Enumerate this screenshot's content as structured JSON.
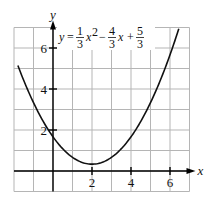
{
  "chart_data": {
    "type": "line",
    "title": "",
    "equation": {
      "display": "y = 1/3 x^2 - 4/3 x + 5/3",
      "lhs": "y",
      "terms": [
        {
          "sign": "",
          "num": "1",
          "den": "3",
          "var": "x",
          "exp": "2"
        },
        {
          "sign": "−",
          "num": "4",
          "den": "3",
          "var": "x",
          "exp": ""
        },
        {
          "sign": "+",
          "num": "5",
          "den": "3",
          "var": "",
          "exp": ""
        }
      ],
      "coefficients": {
        "a": 0.3333,
        "b": -1.3333,
        "c": 1.6667
      }
    },
    "xlabel": "x",
    "ylabel": "y",
    "xlim": [
      -2,
      7
    ],
    "ylim": [
      -1,
      7
    ],
    "grid": true,
    "x_ticks": [
      2,
      4,
      6
    ],
    "y_ticks": [
      2,
      4,
      6
    ],
    "x_tick_labels": [
      "2",
      "4",
      "6"
    ],
    "y_tick_labels": [
      "2",
      "4",
      "6"
    ],
    "vertex": {
      "x": 2,
      "y": 0.3333
    },
    "y_intercept": 1.6667,
    "curve_domain": [
      -1.8,
      6.45
    ],
    "series": [
      {
        "name": "y = 1/3 x^2 - 4/3 x + 5/3",
        "x": [
          -1.8,
          -1,
          0,
          1,
          2,
          3,
          4,
          5,
          6,
          6.45
        ],
        "y": [
          5.15,
          3.0,
          1.67,
          0.67,
          0.33,
          0.67,
          1.67,
          3.0,
          5.0,
          6.94
        ]
      }
    ]
  }
}
